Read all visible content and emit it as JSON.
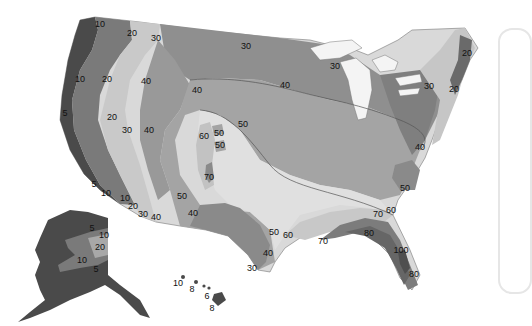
{
  "map": {
    "type": "contour-map",
    "region": "United States (contiguous, Alaska, Hawaii)",
    "shading": "grayscale, darker = lower values in west / higher in Florida",
    "colors": {
      "background": "#ffffff",
      "band_0_5": "#4a4a4a",
      "band_5_10": "#5f5f5f",
      "band_10_20": "#7a7a7a",
      "band_20_30": "#c9c9c9",
      "band_30_40": "#8f8f8f",
      "band_40_50": "#a4a4a4",
      "band_50_60": "#d6d6d6",
      "band_60_70": "#c2c2c2",
      "band_70_80": "#8a8a8a",
      "band_80_100": "#6e6e6e",
      "band_100": "#5a5a5a",
      "lakes": "#f4f4f4",
      "contour_line": "#555555",
      "panel_border": "#e6e6e6"
    },
    "contour_labels": [
      {
        "value": "10",
        "x": 100,
        "y": 24
      },
      {
        "value": "20",
        "x": 132,
        "y": 33
      },
      {
        "value": "30",
        "x": 156,
        "y": 38
      },
      {
        "value": "30",
        "x": 246,
        "y": 46
      },
      {
        "value": "10",
        "x": 80,
        "y": 79
      },
      {
        "value": "20",
        "x": 107,
        "y": 79
      },
      {
        "value": "40",
        "x": 146,
        "y": 81
      },
      {
        "value": "40",
        "x": 197,
        "y": 90
      },
      {
        "value": "40",
        "x": 285,
        "y": 85
      },
      {
        "value": "30",
        "x": 335,
        "y": 66
      },
      {
        "value": "30",
        "x": 429,
        "y": 86
      },
      {
        "value": "20",
        "x": 467,
        "y": 53
      },
      {
        "value": "20",
        "x": 454,
        "y": 89
      },
      {
        "value": "5",
        "x": 65,
        "y": 113
      },
      {
        "value": "20",
        "x": 112,
        "y": 117
      },
      {
        "value": "50",
        "x": 243,
        "y": 124
      },
      {
        "value": "50",
        "x": 219,
        "y": 133
      },
      {
        "value": "60",
        "x": 204,
        "y": 136
      },
      {
        "value": "50",
        "x": 220,
        "y": 145
      },
      {
        "value": "30",
        "x": 127,
        "y": 130
      },
      {
        "value": "40",
        "x": 149,
        "y": 130
      },
      {
        "value": "40",
        "x": 420,
        "y": 147
      },
      {
        "value": "70",
        "x": 209,
        "y": 177
      },
      {
        "value": "50",
        "x": 182,
        "y": 196
      },
      {
        "value": "5",
        "x": 94,
        "y": 184
      },
      {
        "value": "10",
        "x": 106,
        "y": 193
      },
      {
        "value": "10",
        "x": 125,
        "y": 198
      },
      {
        "value": "20",
        "x": 133,
        "y": 206
      },
      {
        "value": "30",
        "x": 143,
        "y": 214
      },
      {
        "value": "40",
        "x": 156,
        "y": 217
      },
      {
        "value": "40",
        "x": 193,
        "y": 213
      },
      {
        "value": "50",
        "x": 405,
        "y": 188
      },
      {
        "value": "60",
        "x": 391,
        "y": 210
      },
      {
        "value": "70",
        "x": 378,
        "y": 214
      },
      {
        "value": "80",
        "x": 369,
        "y": 233
      },
      {
        "value": "50",
        "x": 274,
        "y": 232
      },
      {
        "value": "60",
        "x": 288,
        "y": 235
      },
      {
        "value": "70",
        "x": 323,
        "y": 241
      },
      {
        "value": "100",
        "x": 401,
        "y": 250
      },
      {
        "value": "80",
        "x": 414,
        "y": 274
      },
      {
        "value": "40",
        "x": 268,
        "y": 253
      },
      {
        "value": "30",
        "x": 252,
        "y": 268
      },
      {
        "value": "5",
        "x": 92,
        "y": 228
      },
      {
        "value": "10",
        "x": 104,
        "y": 235
      },
      {
        "value": "20",
        "x": 100,
        "y": 247
      },
      {
        "value": "10",
        "x": 82,
        "y": 260
      },
      {
        "value": "5",
        "x": 96,
        "y": 269
      },
      {
        "value": "10",
        "x": 178,
        "y": 283
      },
      {
        "value": "8",
        "x": 192,
        "y": 289
      },
      {
        "value": "6",
        "x": 207,
        "y": 296
      },
      {
        "value": "8",
        "x": 212,
        "y": 308
      }
    ]
  }
}
